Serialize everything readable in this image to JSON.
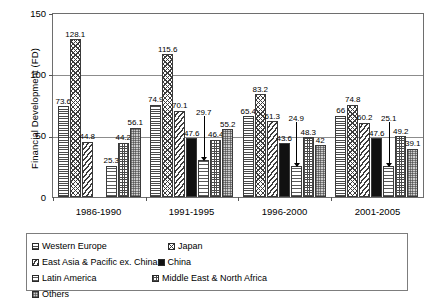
{
  "chart_data": {
    "type": "bar",
    "title": "",
    "xlabel": "",
    "ylabel": "Financial Development (FD)",
    "ylim": [
      0,
      150
    ],
    "yticks": [
      "0",
      "50",
      "100",
      "150"
    ],
    "grid": true,
    "legend_position": "bottom",
    "categories": [
      "1986-1990",
      "1991-1995",
      "1996-2000",
      "2001-2005"
    ],
    "series": [
      {
        "name": "Western Europe",
        "pattern": "horizontal-lines",
        "values": [
          73.6,
          74.9,
          65.4,
          66
        ],
        "labels": [
          "73.6",
          "74.9",
          "65.4",
          "66"
        ]
      },
      {
        "name": "Japan",
        "pattern": "crosshatch",
        "values": [
          128.1,
          115.6,
          83.2,
          74.8
        ],
        "labels": [
          "128.1",
          "115.6",
          "83.2",
          "74.8"
        ]
      },
      {
        "name": "East Asia & Pacific ex. China",
        "pattern": "diagonal-lines",
        "values": [
          44.8,
          70.1,
          61.3,
          60.2
        ],
        "labels": [
          "44.8",
          "70.1",
          "61.3",
          "60.2"
        ]
      },
      {
        "name": "China",
        "pattern": "solid-black",
        "values": [
          null,
          47.6,
          43.6,
          47.6
        ],
        "labels": [
          "",
          "47.6",
          "43.6",
          "47.6"
        ]
      },
      {
        "name": "Latin America",
        "pattern": "wavy-lines",
        "values": [
          25.3,
          29.7,
          24.9,
          25.1
        ],
        "labels": [
          "25.3",
          "29.7",
          "24.9",
          "25.1"
        ],
        "callout": [
          false,
          true,
          true,
          true
        ]
      },
      {
        "name": "Middle East & North Africa",
        "pattern": "grid",
        "values": [
          44.2,
          46.4,
          48.3,
          49.2
        ],
        "labels": [
          "44.2",
          "46.4",
          "48.3",
          "49.2"
        ]
      },
      {
        "name": "Others",
        "pattern": "dotted-gray",
        "values": [
          56.1,
          55.2,
          42,
          39.1
        ],
        "labels": [
          "56.1",
          "55.2",
          "42",
          "39.1"
        ]
      }
    ]
  },
  "axis": {
    "y_title": "Financial Development (FD)",
    "y_tick_150": "150",
    "y_tick_100": "100",
    "y_tick_50": "50",
    "y_tick_0": "0",
    "x_tick_0": "1986-1990",
    "x_tick_1": "1991-1995",
    "x_tick_2": "1996-2000",
    "x_tick_3": "2001-2005"
  },
  "legend": {
    "items": [
      {
        "label": "Western Europe",
        "pattern": "horizontal-lines"
      },
      {
        "label": "Japan",
        "pattern": "crosshatch"
      },
      {
        "label": "East Asia & Pacific ex. China",
        "pattern": "diagonal-lines"
      },
      {
        "label": "China",
        "pattern": "solid-black"
      },
      {
        "label": "Latin America",
        "pattern": "wavy-lines"
      },
      {
        "label": "Middle East & North Africa",
        "pattern": "grid"
      },
      {
        "label": "Others",
        "pattern": "dotted-gray"
      }
    ]
  }
}
